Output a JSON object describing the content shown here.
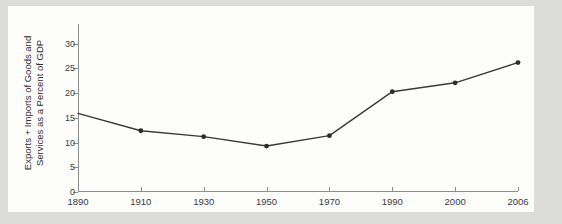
{
  "page": {
    "background_color": "#dcdcda",
    "card_color": "#fdfdfc"
  },
  "chart_data": {
    "type": "line",
    "title": "",
    "subtitle": "",
    "xlabel": "",
    "ylabel": "Exports + Imports of Goods and\nServices as a Percent of GDP",
    "categories": [
      "1890",
      "1910",
      "1930",
      "1950",
      "1970",
      "1990",
      "2000",
      "2006"
    ],
    "values": [
      15.9,
      12.4,
      11.2,
      9.3,
      11.4,
      20.3,
      22.1,
      26.2
    ],
    "series": [
      {
        "name": "Exports + Imports of Goods and Services as a Percent of GDP",
        "values": [
          15.9,
          12.4,
          11.2,
          9.3,
          11.4,
          20.3,
          22.1,
          26.2
        ]
      }
    ],
    "ylim": [
      0,
      34
    ],
    "y_ticks": [
      0,
      5,
      10,
      15,
      20,
      25,
      30
    ],
    "y_tick_labels": [
      "0",
      "5",
      "10",
      "15",
      "20",
      "25",
      "30"
    ],
    "x_tick_labels": [
      "1890",
      "1910",
      "1930",
      "1950",
      "1970",
      "1990",
      "2000",
      "2006"
    ],
    "grid": false,
    "legend": false,
    "legend_position": "none",
    "line_color": "#3a3a3a",
    "marker_color": "#2b2b2b",
    "axis_color": "#8e8e8e",
    "marker": "circle",
    "first_point_marker": false
  }
}
